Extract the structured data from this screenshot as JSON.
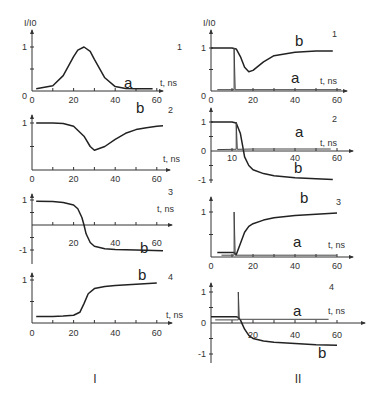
{
  "figure": {
    "column_labels": [
      "I",
      "II"
    ],
    "y_axis_label": "I/I0",
    "x_axis_label": "t, ns"
  },
  "chart_data": [
    {
      "id": "I-1",
      "type": "line",
      "column": "I",
      "panel_number": "1",
      "title": "",
      "xlabel": "t, ns",
      "ylabel": "I/I0",
      "xlim": [
        0,
        60
      ],
      "ylim": [
        0,
        1
      ],
      "x_ticks": [
        "0",
        "20",
        "40",
        "60"
      ],
      "y_ticks": [
        "0",
        "1"
      ],
      "series": [
        {
          "name": "a",
          "x": [
            2,
            10,
            15,
            20,
            22,
            25,
            28,
            30,
            35,
            40,
            45,
            50,
            58
          ],
          "y": [
            0.05,
            0.12,
            0.35,
            0.78,
            0.93,
            1.0,
            0.9,
            0.72,
            0.3,
            0.1,
            0.06,
            0.05,
            0.05
          ]
        }
      ]
    },
    {
      "id": "I-2",
      "type": "line",
      "column": "I",
      "panel_number": "2",
      "xlabel": "t, ns",
      "ylabel": "",
      "xlim": [
        0,
        60
      ],
      "ylim": [
        0,
        1
      ],
      "x_ticks": [
        "0",
        "20",
        "40",
        "60"
      ],
      "y_ticks": [
        "1"
      ],
      "series": [
        {
          "name": "b",
          "x": [
            2,
            10,
            15,
            20,
            25,
            28,
            30,
            35,
            40,
            45,
            50,
            55,
            60,
            63
          ],
          "y": [
            1.0,
            1.0,
            0.99,
            0.93,
            0.72,
            0.5,
            0.42,
            0.5,
            0.65,
            0.78,
            0.86,
            0.9,
            0.93,
            0.94
          ]
        }
      ]
    },
    {
      "id": "I-3",
      "type": "line",
      "column": "I",
      "panel_number": "3",
      "xlabel": "t, ns",
      "ylabel": "",
      "xlim": [
        0,
        60
      ],
      "ylim": [
        -1,
        1
      ],
      "x_ticks": [
        "20",
        "40",
        "60"
      ],
      "y_ticks": [
        "1",
        "-1"
      ],
      "series": [
        {
          "name": "b",
          "x": [
            2,
            10,
            15,
            20,
            22,
            24,
            25,
            26,
            28,
            30,
            35,
            40,
            50,
            63
          ],
          "y": [
            0.95,
            0.94,
            0.9,
            0.8,
            0.65,
            0.3,
            0.0,
            -0.35,
            -0.7,
            -0.85,
            -0.95,
            -0.98,
            -1.0,
            -1.03
          ]
        }
      ]
    },
    {
      "id": "I-4",
      "type": "line",
      "column": "I",
      "panel_number": "4",
      "xlabel": "t, ns",
      "ylabel": "",
      "xlim": [
        0,
        60
      ],
      "ylim": [
        0,
        1
      ],
      "x_ticks": [
        "0",
        "20",
        "40",
        "60"
      ],
      "y_ticks": [
        "1"
      ],
      "series": [
        {
          "name": "b",
          "x": [
            2,
            10,
            15,
            20,
            23,
            25,
            27,
            30,
            35,
            40,
            50,
            60
          ],
          "y": [
            0.15,
            0.15,
            0.16,
            0.18,
            0.25,
            0.45,
            0.68,
            0.8,
            0.85,
            0.87,
            0.9,
            0.93
          ]
        }
      ]
    },
    {
      "id": "II-1",
      "type": "line",
      "column": "II",
      "panel_number": "1",
      "xlabel": "t, ns",
      "ylabel": "I/I0",
      "xlim": [
        0,
        60
      ],
      "ylim": [
        0,
        1
      ],
      "x_ticks": [
        "0",
        "20",
        "40",
        "60"
      ],
      "y_ticks": [
        "0",
        "1"
      ],
      "series": [
        {
          "name": "b",
          "x": [
            0,
            10,
            12,
            14,
            16,
            18,
            20,
            25,
            30,
            40,
            50,
            58
          ],
          "y": [
            1.0,
            1.0,
            0.98,
            0.8,
            0.55,
            0.45,
            0.48,
            0.68,
            0.82,
            0.9,
            0.93,
            0.93
          ]
        },
        {
          "name": "a",
          "x": [
            3,
            11,
            11,
            11.5,
            20,
            40,
            62
          ],
          "y": [
            0.03,
            0.03,
            1.0,
            0.03,
            0.03,
            0.03,
            0.03
          ]
        }
      ]
    },
    {
      "id": "II-2",
      "type": "line",
      "column": "II",
      "panel_number": "2",
      "xlabel": "t, ns",
      "ylabel": "",
      "xlim": [
        0,
        60
      ],
      "ylim": [
        -1,
        1
      ],
      "x_ticks": [
        "10",
        "40",
        "60"
      ],
      "y_ticks": [
        "1",
        "0",
        "-1"
      ],
      "series": [
        {
          "name": "b",
          "x": [
            0,
            10,
            12,
            14,
            15,
            16,
            18,
            20,
            25,
            30,
            40,
            50,
            58
          ],
          "y": [
            1.0,
            1.0,
            0.97,
            0.6,
            0.2,
            -0.2,
            -0.5,
            -0.65,
            -0.78,
            -0.85,
            -0.92,
            -0.96,
            -0.98
          ]
        },
        {
          "name": "a",
          "x": [
            3,
            11,
            12,
            12,
            12.5,
            20,
            40,
            57
          ],
          "y": [
            0.05,
            0.06,
            0.06,
            1.0,
            0.06,
            0.07,
            0.07,
            0.07
          ]
        }
      ]
    },
    {
      "id": "II-3",
      "type": "line",
      "column": "II",
      "panel_number": "3",
      "xlabel": "t, ns",
      "ylabel": "",
      "xlim": [
        0,
        60
      ],
      "ylim": [
        0,
        1
      ],
      "x_ticks": [
        "0",
        "20",
        "40",
        "60"
      ],
      "y_ticks": [
        "1"
      ],
      "series": [
        {
          "name": "b",
          "x": [
            3,
            11,
            12,
            14,
            16,
            18,
            20,
            25,
            30,
            40,
            50,
            60
          ],
          "y": [
            0.1,
            0.1,
            0.05,
            0.3,
            0.55,
            0.68,
            0.74,
            0.82,
            0.87,
            0.92,
            0.95,
            0.98
          ]
        },
        {
          "name": "a",
          "x": [
            5,
            11,
            11,
            11.5,
            20,
            40,
            60
          ],
          "y": [
            0.04,
            0.04,
            1.0,
            0.04,
            0.04,
            0.04,
            0.04
          ]
        }
      ]
    },
    {
      "id": "II-4",
      "type": "line",
      "column": "II",
      "panel_number": "4",
      "xlabel": "t, ns",
      "ylabel": "",
      "xlim": [
        0,
        60
      ],
      "ylim": [
        -1,
        1
      ],
      "x_ticks": [
        "20",
        "40",
        "60"
      ],
      "y_ticks": [
        "1",
        "0",
        "-1"
      ],
      "series": [
        {
          "name": "b",
          "x": [
            0,
            12,
            13,
            14,
            15,
            16,
            18,
            20,
            25,
            30,
            40,
            50,
            60
          ],
          "y": [
            0.2,
            0.2,
            0.18,
            0.1,
            -0.05,
            -0.2,
            -0.4,
            -0.5,
            -0.58,
            -0.62,
            -0.66,
            -0.7,
            -0.72
          ]
        },
        {
          "name": "a",
          "x": [
            2,
            12,
            13,
            13,
            13.5,
            20,
            40,
            56
          ],
          "y": [
            0.1,
            0.1,
            0.1,
            1.0,
            0.12,
            0.12,
            0.12,
            0.12
          ]
        }
      ]
    }
  ]
}
